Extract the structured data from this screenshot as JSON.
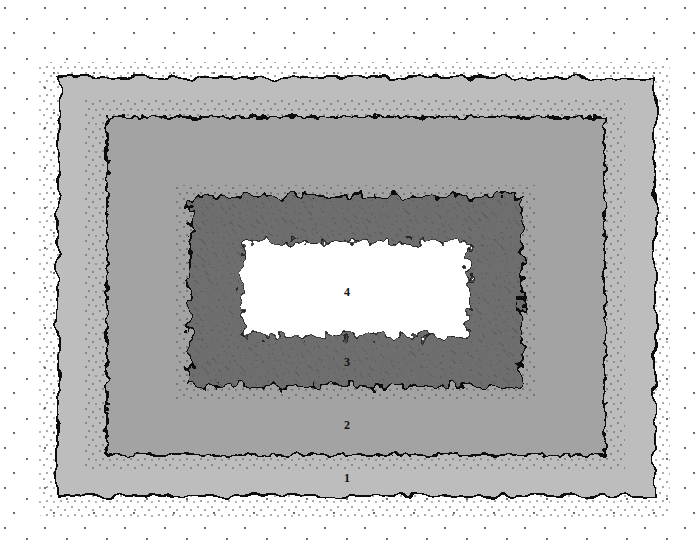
{
  "diagram": {
    "type": "concentric-zones",
    "zones": [
      {
        "id": 1,
        "label": "1",
        "color": "#bdbdbd",
        "label_pos": [
          347,
          478
        ]
      },
      {
        "id": 2,
        "label": "2",
        "color": "#a3a3a3",
        "label_pos": [
          347,
          425
        ]
      },
      {
        "id": 3,
        "label": "3",
        "color": "#6e6e6e",
        "label_pos": [
          347,
          362
        ]
      },
      {
        "id": 4,
        "label": "4",
        "color": "#ffffff",
        "label_pos": [
          347,
          292
        ]
      }
    ],
    "outline_color": "#111111",
    "stipple_color": "#222222"
  }
}
